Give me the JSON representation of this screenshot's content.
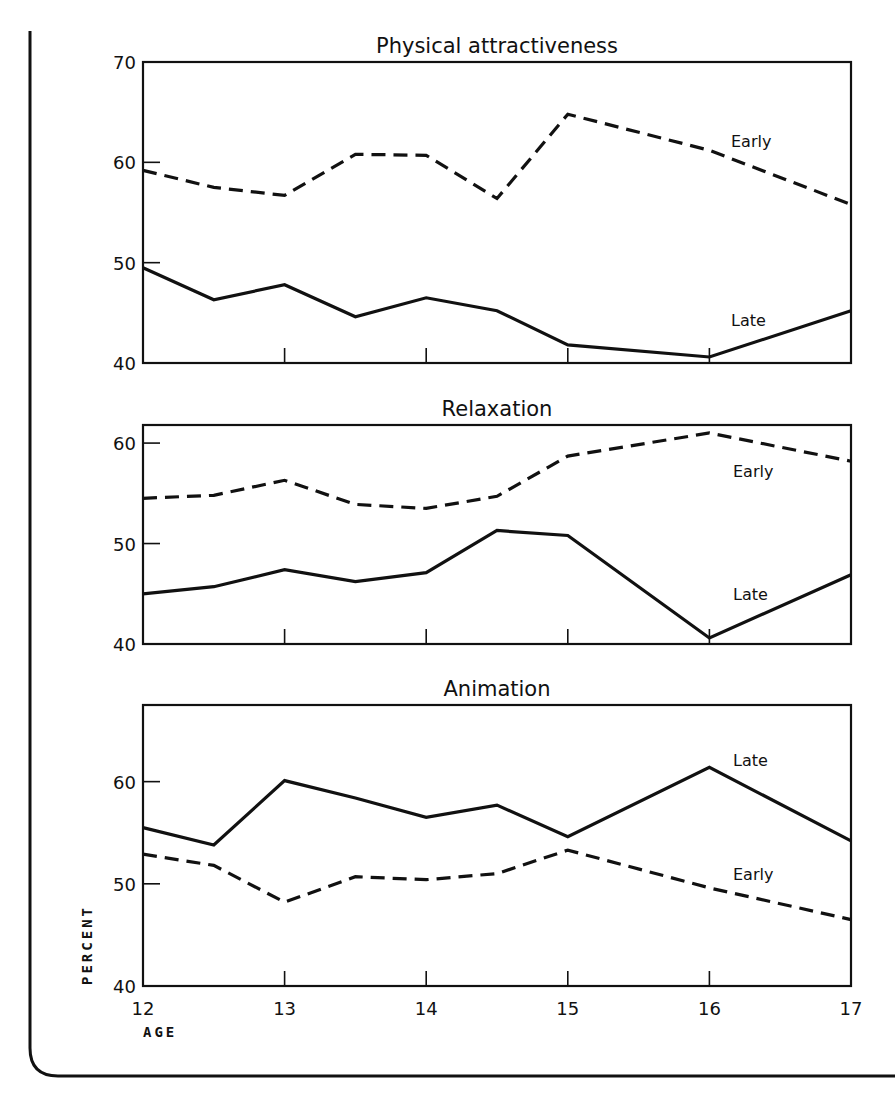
{
  "chart_data": [
    {
      "type": "line",
      "title": "Physical attractiveness",
      "xlabel": "AGE",
      "ylabel": "PERCENT",
      "x": [
        12,
        12.5,
        13,
        13.5,
        14,
        14.5,
        15,
        16,
        17
      ],
      "xlim": [
        12,
        17
      ],
      "ylim": [
        40,
        70
      ],
      "yticks": [
        40,
        50,
        60,
        70
      ],
      "xticks": [
        12,
        13,
        14,
        15,
        16,
        17
      ],
      "grid": false,
      "series": [
        {
          "name": "Early",
          "style": "dashed",
          "values": [
            59.2,
            57.5,
            56.7,
            60.8,
            60.7,
            56.4,
            64.8,
            61.2,
            55.8
          ]
        },
        {
          "name": "Late",
          "style": "solid",
          "values": [
            49.5,
            46.3,
            47.8,
            44.6,
            46.5,
            45.2,
            41.8,
            40.6,
            45.2
          ]
        }
      ]
    },
    {
      "type": "line",
      "title": "Relaxation",
      "xlabel": "AGE",
      "ylabel": "PERCENT",
      "x": [
        12,
        12.5,
        13,
        13.5,
        14,
        14.5,
        15,
        16,
        17
      ],
      "xlim": [
        12,
        17
      ],
      "ylim": [
        40,
        61.8
      ],
      "yticks": [
        40,
        50,
        60
      ],
      "xticks": [
        12,
        13,
        14,
        15,
        16,
        17
      ],
      "grid": false,
      "series": [
        {
          "name": "Early",
          "style": "dashed",
          "values": [
            54.5,
            54.8,
            56.3,
            53.9,
            53.5,
            54.7,
            58.7,
            61.0,
            58.2
          ]
        },
        {
          "name": "Late",
          "style": "solid",
          "values": [
            45.0,
            45.7,
            47.4,
            46.2,
            47.1,
            51.3,
            50.8,
            40.6,
            46.9
          ]
        }
      ]
    },
    {
      "type": "line",
      "title": "Animation",
      "xlabel": "AGE",
      "ylabel": "PERCENT",
      "x": [
        12,
        12.5,
        13,
        13.5,
        14,
        14.5,
        15,
        16,
        17
      ],
      "xlim": [
        12,
        17
      ],
      "ylim": [
        40,
        67.5
      ],
      "yticks": [
        40,
        50,
        60
      ],
      "xticks": [
        12,
        13,
        14,
        15,
        16,
        17
      ],
      "grid": false,
      "series": [
        {
          "name": "Late",
          "style": "solid",
          "values": [
            55.5,
            53.8,
            60.1,
            58.4,
            56.5,
            57.7,
            54.6,
            61.4,
            54.2
          ]
        },
        {
          "name": "Early",
          "style": "dashed",
          "values": [
            52.9,
            51.8,
            48.2,
            50.7,
            50.4,
            51.0,
            53.3,
            49.6,
            46.5
          ]
        }
      ]
    }
  ],
  "layout": {
    "panels": [
      {
        "left": 143,
        "right": 851,
        "top": 62,
        "bottom": 363,
        "title_y": 24,
        "labels": [
          {
            "series": "Early",
            "x": 731,
            "y": 147
          },
          {
            "series": "Late",
            "x": 731,
            "y": 326
          }
        ],
        "show_x_labels": false
      },
      {
        "left": 143,
        "right": 851,
        "top": 425,
        "bottom": 644,
        "title_y": 409,
        "labels": [
          {
            "series": "Early",
            "x": 733,
            "y": 477
          },
          {
            "series": "Late",
            "x": 733,
            "y": 600
          }
        ],
        "show_x_labels": false
      },
      {
        "left": 143,
        "right": 851,
        "top": 705,
        "bottom": 986,
        "title_y": 690,
        "labels": [
          {
            "series": "Late",
            "x": 733,
            "y": 766
          },
          {
            "series": "Early",
            "x": 733,
            "y": 880
          }
        ],
        "show_x_labels": true
      }
    ]
  },
  "axis_labels": {
    "x": "AGE",
    "y": "PERCENT"
  }
}
